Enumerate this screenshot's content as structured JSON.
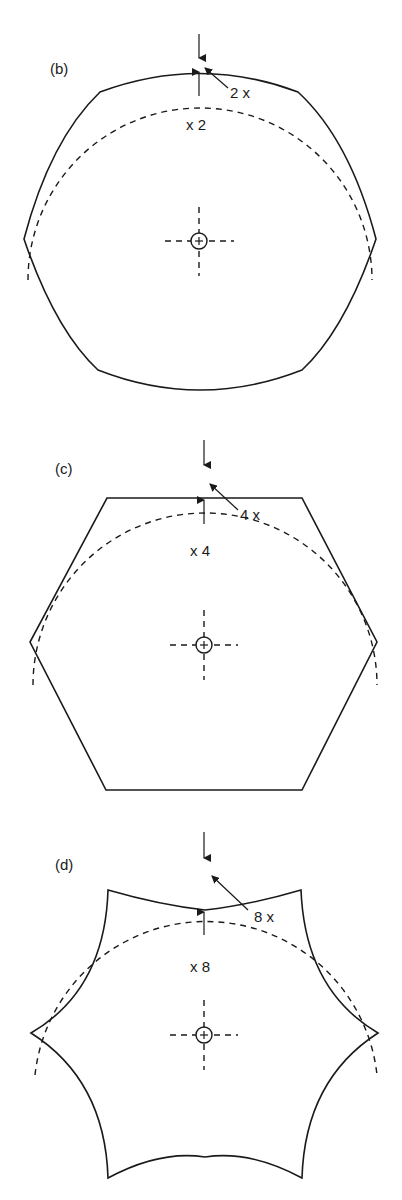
{
  "figure": {
    "panels": [
      {
        "id": "b",
        "label": "(b)",
        "inner_label": "x 2",
        "callout_label": "2 x",
        "shape": "slightly flattened hexagonal lobed profile"
      },
      {
        "id": "c",
        "label": "(c)",
        "inner_label": "x 4",
        "callout_label": "4 x",
        "shape": "hexagon"
      },
      {
        "id": "d",
        "label": "(d)",
        "inner_label": "x 8",
        "callout_label": "8 x",
        "shape": "six-pointed concave star profile"
      }
    ],
    "center_mark": "circle-with-plus crosshair",
    "line_color": "#1a1a1a",
    "background": "#ffffff"
  }
}
